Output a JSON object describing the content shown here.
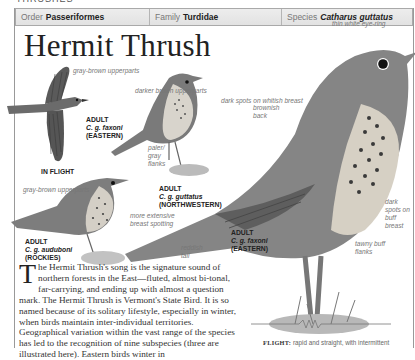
{
  "section_title": "THRUSHES",
  "taxonomy": {
    "order": {
      "label": "Order",
      "value": "Passeriformes"
    },
    "family": {
      "label": "Family",
      "value": "Turdidae"
    },
    "species": {
      "label": "Species",
      "value": "Catharus guttatus"
    }
  },
  "title": "Hermit Thrush",
  "illustrations": [
    {
      "id": "flight",
      "caption": {
        "age": "ADULT",
        "subspecies": "C. g. faxoni",
        "region": "(EASTERN)"
      },
      "sub_caption": "IN FLIGHT",
      "labels": [
        "gray-brown upperparts"
      ]
    },
    {
      "id": "northwestern",
      "caption": {
        "age": "ADULT",
        "subspecies": "C. g. guttatus",
        "region": "(NORTHWESTERN)"
      },
      "labels": [
        "darker brown upperparts",
        "dark spots on whitish breast",
        "paler/ gray flanks"
      ]
    },
    {
      "id": "rockies",
      "caption": {
        "age": "ADULT",
        "subspecies": "C. g. auduboni",
        "region": "(ROCKIES)"
      },
      "labels": [
        "gray-brown upperparts",
        "more extensive breast spotting"
      ]
    },
    {
      "id": "eastern",
      "caption": {
        "age": "ADULT",
        "subspecies": "C. g. faxoni",
        "region": "(EASTERN)"
      },
      "labels": [
        "thin white eye-ring",
        "brownish back",
        "dark spots on buff breast",
        "tawny buff flanks",
        "reddish tail"
      ]
    }
  ],
  "body": {
    "dropcap": "T",
    "text": "he Hermit Thrush's song is the signature sound of northern forests in the East—fluted, almost bi-tonal, far-carrying, and ending up with almost a question mark. The Hermit Thrush is Vermont's State Bird. It is so named because of its solitary lifestyle, especially in winter, when birds maintain inter-individual territories. Geographical variation within the vast range of the species has led to the recognition of nine subspecies (three are illustrated here). Eastern birds winter in"
  },
  "flight": {
    "label": "FLIGHT:",
    "text": "rapid and straight, with intermittent"
  },
  "colors": {
    "taxbar_bg": "#e6e6e6",
    "border": "#a9a9a9",
    "label_gray": "#777777",
    "bird_dark": "#4a4a4a",
    "bird_mid": "#8a8a8a",
    "bird_light": "#cfcfcf"
  }
}
